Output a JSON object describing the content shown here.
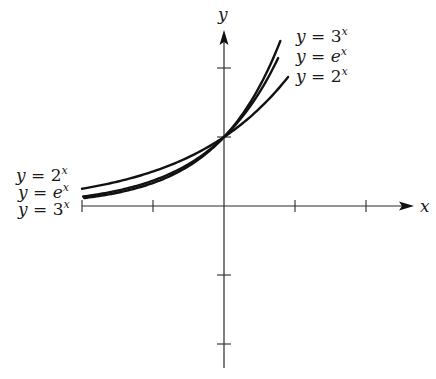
{
  "chart_data": {
    "type": "line",
    "title": "",
    "xlabel": "x",
    "ylabel": "y",
    "xlim": [
      -2,
      2.6
    ],
    "ylim": [
      -2.5,
      2.6
    ],
    "x_ticks": [
      -2,
      -1,
      1,
      2
    ],
    "y_ticks": [
      -2,
      -1,
      1,
      2
    ],
    "tick_labels_shown": false,
    "grid": false,
    "legend_position": "inline labels at curve ends",
    "domain": [
      -2,
      0.88
    ],
    "series": [
      {
        "name": "y = 2^x",
        "base": 2,
        "label_left": {
          "prefix": "y = 2",
          "sup": "x"
        },
        "label_right": {
          "prefix": "y = 2",
          "sup": "x"
        }
      },
      {
        "name": "y = e^x",
        "base": 2.718281828,
        "label_left": {
          "prefix": "y = e",
          "sup": "x"
        },
        "label_right": {
          "prefix": "y = e",
          "sup": "x"
        }
      },
      {
        "name": "y = 3^x",
        "base": 3,
        "label_left": {
          "prefix": "y = 3",
          "sup": "x"
        },
        "label_right": {
          "prefix": "y = 3",
          "sup": "x"
        }
      }
    ],
    "annotations": [
      "All curves pass through (0, 1)"
    ]
  },
  "axes": {
    "x_label": "x",
    "y_label": "y"
  },
  "labels_right": [
    {
      "text": "y = 3",
      "sup": "x"
    },
    {
      "text": "y = e",
      "sup": "x"
    },
    {
      "text": "y = 2",
      "sup": "x"
    }
  ],
  "labels_left": [
    {
      "text": "y = 2",
      "sup": "x"
    },
    {
      "text": "y = e",
      "sup": "x"
    },
    {
      "text": "y = 3",
      "sup": "x"
    }
  ]
}
